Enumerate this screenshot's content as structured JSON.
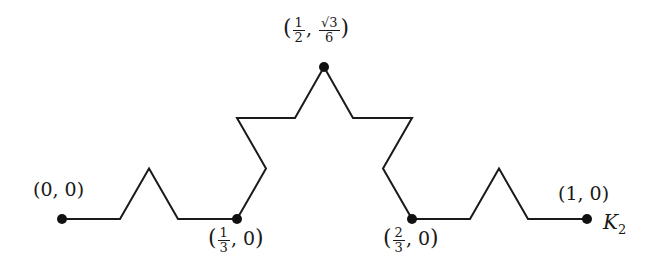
{
  "diagram": {
    "curve_label": {
      "main": "K",
      "sub": "2"
    },
    "stroke_color": "#1a1a1a",
    "point_color": "#111111",
    "background": "#ffffff",
    "labels": {
      "p0": {
        "open": "(",
        "x": "0",
        "sep": ", ",
        "y": "0",
        "close": ")"
      },
      "p1": {
        "open": "(",
        "x_num": "1",
        "x_den": "3",
        "sep": ", ",
        "y": "0",
        "close": ")"
      },
      "p2": {
        "open": "(",
        "x_num": "1",
        "x_den": "2",
        "sep": ", ",
        "y_num": "√3",
        "y_den": "6",
        "close": ")"
      },
      "p3": {
        "open": "(",
        "x_num": "2",
        "x_den": "3",
        "sep": ", ",
        "y": "0",
        "close": ")"
      },
      "p4": {
        "open": "(",
        "x": "1",
        "sep": ", ",
        "y": "0",
        "close": ")"
      }
    },
    "marked_points": [
      {
        "x": "0",
        "y": "0"
      },
      {
        "x": "1/3",
        "y": "0"
      },
      {
        "x": "1/2",
        "y": "√3/6"
      },
      {
        "x": "2/3",
        "y": "0"
      },
      {
        "x": "1",
        "y": "0"
      }
    ]
  }
}
